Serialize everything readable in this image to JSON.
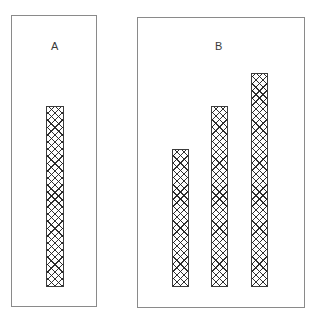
{
  "figure": {
    "width": 317,
    "height": 317,
    "background_color": "#ffffff",
    "border_color": "#8a8a8a",
    "bar_outline_color": "#3b3b3b",
    "bar_fill_pattern": "crosshatch-diagonal",
    "bar_fill_color": "#1e1e1e",
    "label_color": "#3a3a3a"
  },
  "panels": [
    {
      "label": "A",
      "label_x": 55,
      "label_y": 41,
      "x": 11,
      "y": 15,
      "width": 86,
      "height": 292
    },
    {
      "label": "B",
      "label_x": 219,
      "label_y": 41,
      "x": 137,
      "y": 17,
      "width": 168,
      "height": 291
    }
  ],
  "bars": [
    {
      "panel": "A",
      "index": 0,
      "x": 46,
      "y": 106,
      "width": 18,
      "height": 181
    },
    {
      "panel": "B",
      "index": 0,
      "x": 172,
      "y": 149,
      "width": 17,
      "height": 138
    },
    {
      "panel": "B",
      "index": 1,
      "x": 211,
      "y": 106,
      "width": 17,
      "height": 181
    },
    {
      "panel": "B",
      "index": 2,
      "x": 251,
      "y": 73,
      "width": 17,
      "height": 214
    }
  ],
  "chart_data": {
    "type": "bar",
    "title": "",
    "xlabel": "",
    "ylabel": "",
    "grid": false,
    "legend": false,
    "baseline_y_px": 287,
    "panels": [
      {
        "name": "A",
        "categories": [
          "1"
        ],
        "values": [
          181
        ],
        "ylim": [
          0,
          272
        ],
        "note": "single crosshatched bar"
      },
      {
        "name": "B",
        "categories": [
          "1",
          "2",
          "3"
        ],
        "values": [
          138,
          181,
          214
        ],
        "ylim": [
          0,
          270
        ],
        "note": "three crosshatched bars of increasing height"
      }
    ]
  }
}
